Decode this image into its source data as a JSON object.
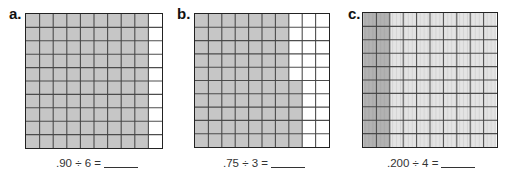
{
  "colors": {
    "shade": "#c6c6c6",
    "line": "#444444",
    "border": "#222222"
  },
  "problems": [
    {
      "label": "a.",
      "equation": ".90 ÷ 6 =",
      "grid": {
        "rows": 10,
        "cols": 10,
        "subcols": 1,
        "shaded_full_cols": 9,
        "partial_col_shaded_rows_from_bottom": 0
      },
      "represents": 0.9
    },
    {
      "label": "b.",
      "equation": ".75 ÷ 3 =",
      "grid": {
        "rows": 10,
        "cols": 10,
        "subcols": 1,
        "shaded_full_cols": 7,
        "partial_col_shaded_rows_from_bottom": 5
      },
      "represents": 0.75
    },
    {
      "label": "c.",
      "equation": ".200 ÷ 4 =",
      "grid": {
        "rows": 10,
        "cols": 10,
        "subcols": 10,
        "shaded_full_cols": 2,
        "partial_col_shaded_rows_from_bottom": 0
      },
      "represents": 0.2
    }
  ]
}
